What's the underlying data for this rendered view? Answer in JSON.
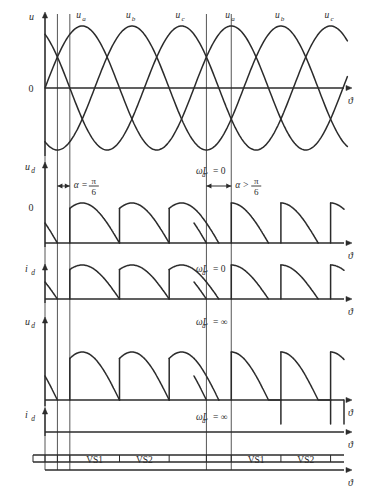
{
  "figure": {
    "background": "#ffffff",
    "ink": "#2b2b2b",
    "width": 380,
    "height": 497
  },
  "axis_symbol": "ϑ",
  "zero_label": "0",
  "panels": [
    {
      "id": "panel-source-voltage",
      "y_label": "u",
      "y_label_sub": "",
      "axis_label": "ϑ",
      "zero_tick": "0",
      "phase_labels": [
        "u",
        "u",
        "u"
      ],
      "phase_subs": [
        "a",
        "b",
        "c"
      ],
      "note": "",
      "type": "three-phase-sine"
    },
    {
      "id": "panel-ud-lightload",
      "y_label": "u",
      "y_label_sub": "d",
      "axis_label": "ϑ",
      "zero_tick": "0",
      "note_left": "",
      "note_center": "ωL",
      "note_center_sub": "d",
      "note_center_tail": " = 0",
      "alpha_left": "α =",
      "alpha_left_num": "π",
      "alpha_left_den": "6",
      "alpha_right": "α >",
      "alpha_right_num": "π",
      "alpha_right_den": "6",
      "type": "rectified-discontinuous"
    },
    {
      "id": "panel-id-lightload",
      "y_label": "i",
      "y_label_sub": "d",
      "axis_label": "ϑ",
      "note_center": "ωL",
      "note_center_sub": "d",
      "note_center_tail": " = 0",
      "type": "current-discontinuous"
    },
    {
      "id": "panel-ud-inductive",
      "y_label": "u",
      "y_label_sub": "d",
      "axis_label": "ϑ",
      "note_center": "ωL",
      "note_center_sub": "d",
      "note_center_tail": " = ∞",
      "type": "rectified-continuous"
    },
    {
      "id": "panel-id-inductive",
      "y_label": "i",
      "y_label_sub": "d",
      "axis_label": "ϑ",
      "note_center": "ωL",
      "note_center_sub": "d",
      "note_center_tail": " = ∞",
      "type": "current-constant"
    },
    {
      "id": "panel-device-conduction",
      "axis_label": "ϑ",
      "segments_left": [
        "",
        "",
        "VS1",
        "VS2",
        ""
      ],
      "segments_right": [
        "",
        "VS1",
        "VS2",
        ""
      ],
      "type": "conduction-bar"
    }
  ],
  "device_labels": {
    "vs1": "VS1",
    "vs2": "VS2"
  },
  "chart_data": {
    "type": "line",
    "xlabel": "ϑ",
    "ylabel": "u, u_d, i_d",
    "grid": false,
    "legend": [
      "u_a",
      "u_b",
      "u_c"
    ],
    "notes": [
      "α = π/6",
      "α > π/6",
      "ωL_d = 0",
      "ωL_d = ∞"
    ],
    "phase_offsets_deg": [
      0,
      120,
      240
    ],
    "firing_angle_left_deg": 30,
    "firing_angle_right_deg": 60,
    "cycles_shown": 2,
    "series": [
      {
        "name": "u_a",
        "phase_deg": 0,
        "amplitude": 1
      },
      {
        "name": "u_b",
        "phase_deg": 120,
        "amplitude": 1
      },
      {
        "name": "u_c",
        "phase_deg": 240,
        "amplitude": 1
      }
    ]
  }
}
